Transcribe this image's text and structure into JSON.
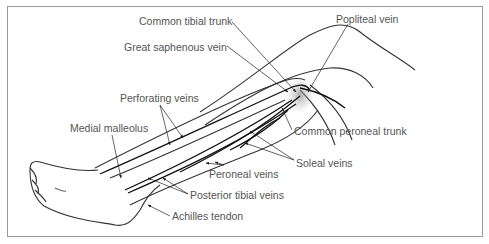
{
  "diagram": {
    "labels": [
      {
        "id": "common-tibial-trunk",
        "text": "Common tibial trunk",
        "x": 139,
        "y": 15
      },
      {
        "id": "great-saphenous-vein",
        "text": "Great saphenous vein",
        "x": 124,
        "y": 41
      },
      {
        "id": "popliteal-vein",
        "text": "Popliteal vein",
        "x": 336,
        "y": 13
      },
      {
        "id": "perforating-veins",
        "text": "Perforating veins",
        "x": 120,
        "y": 92
      },
      {
        "id": "medial-malleolus",
        "text": "Medial malleolus",
        "x": 70,
        "y": 122
      },
      {
        "id": "common-peroneal-trunk",
        "text": "Common peroneal trunk",
        "x": 294,
        "y": 125
      },
      {
        "id": "soleal-veins",
        "text": "Soleal veins",
        "x": 296,
        "y": 157
      },
      {
        "id": "peroneal-veins",
        "text": "Peroneal veins",
        "x": 209,
        "y": 168
      },
      {
        "id": "posterior-tibial-veins",
        "text": "Posterior tibial veins",
        "x": 190,
        "y": 189
      },
      {
        "id": "achilles-tendon",
        "text": "Achilles tendon",
        "x": 172,
        "y": 210
      }
    ]
  }
}
